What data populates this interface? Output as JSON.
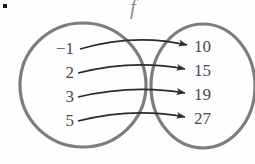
{
  "figure": {
    "bullet": "▪",
    "function_label": "f",
    "type": "mapping-diagram"
  },
  "colors": {
    "oval_stroke": "#7d7d7d",
    "arrow_stroke": "#2b2b2b",
    "text": "#4a4a4a",
    "label": "#8e8e8e",
    "background": "#fefefe"
  },
  "domain": {
    "name": "domain-oval",
    "center_x": 83,
    "center_y": 85,
    "radius_x": 63,
    "radius_y": 62,
    "values": [
      "−1",
      "2",
      "3",
      "5"
    ]
  },
  "range": {
    "name": "range-oval",
    "center_x": 203,
    "center_y": 86,
    "radius_x": 52,
    "radius_y": 62,
    "values": [
      "10",
      "15",
      "19",
      "27"
    ]
  },
  "mappings": [
    {
      "from": "−1",
      "to": "10"
    },
    {
      "from": "2",
      "to": "15"
    },
    {
      "from": "3",
      "to": "19"
    },
    {
      "from": "5",
      "to": "27"
    }
  ],
  "rows": {
    "y": [
      47,
      72,
      96,
      120
    ]
  }
}
